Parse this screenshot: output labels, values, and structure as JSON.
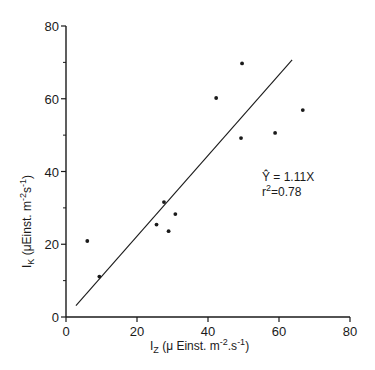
{
  "chart_data": {
    "type": "scatter",
    "title": "",
    "xlabel": "I_Z (μEinst. m-2.s-1)",
    "ylabel": "I_K (μEinst. m-2.s-1)",
    "xlim": [
      0,
      80
    ],
    "ylim": [
      0,
      80
    ],
    "xticks": [
      0,
      20,
      40,
      60,
      80
    ],
    "yticks": [
      0,
      20,
      40,
      60,
      80
    ],
    "y_minor_ticks": [
      10,
      30,
      50,
      70
    ],
    "grid": false,
    "legend": null,
    "series": [
      {
        "name": "observations",
        "points": [
          {
            "x": 6.0,
            "y": 20.9
          },
          {
            "x": 9.4,
            "y": 11.1
          },
          {
            "x": 25.5,
            "y": 25.4
          },
          {
            "x": 27.6,
            "y": 31.6
          },
          {
            "x": 28.9,
            "y": 23.6
          },
          {
            "x": 30.8,
            "y": 28.3
          },
          {
            "x": 42.3,
            "y": 60.2
          },
          {
            "x": 49.6,
            "y": 69.7
          },
          {
            "x": 49.3,
            "y": 49.2
          },
          {
            "x": 58.9,
            "y": 50.6
          },
          {
            "x": 66.7,
            "y": 56.9
          }
        ]
      }
    ],
    "fit_line": {
      "equation": "Y = 1.11X",
      "slope": 1.11,
      "x_start": 2.8,
      "x_end": 63.7
    },
    "annotations": [
      {
        "text_main": "Ŷ = 1.11X",
        "x": 55,
        "y": 38
      },
      {
        "text_main": "r",
        "superscript": "2",
        "text_after": "=0.78",
        "x": 55,
        "y": 34
      }
    ]
  },
  "axes": {
    "x_label_main": "I",
    "x_label_sub": "Z",
    "x_label_units_pre": " (μ Einst. m",
    "x_label_exp1": "-2",
    "x_label_units_mid": ".s",
    "x_label_exp2": "-1",
    "x_label_units_post": ")",
    "y_label_main": "I",
    "y_label_sub": "K",
    "y_label_units_pre": " (μEinst. m",
    "y_label_exp1": "-2",
    "y_label_units_mid": "s",
    "y_label_exp2": "-1",
    "y_label_units_post": ")"
  },
  "annotation": {
    "equation": "Ŷ = 1.11X",
    "r_label": "r",
    "r_exp": "2",
    "r_value": "=0.78"
  }
}
